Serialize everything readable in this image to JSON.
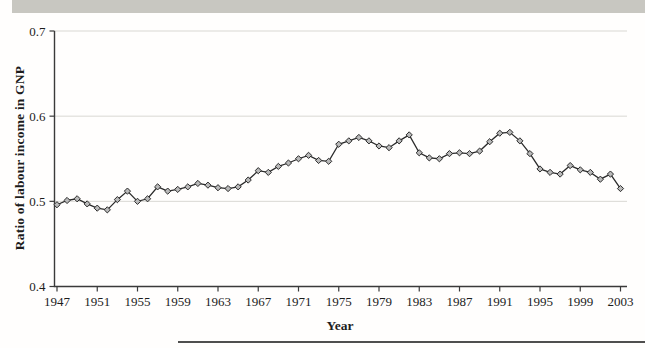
{
  "scan_artifacts": {
    "top_bar_color": "#c8c7c1",
    "bottom_rule_color": "#4f4f4f"
  },
  "chart_data": {
    "type": "line",
    "title": "",
    "ylabel": "Ratio of labour income in GNP",
    "xlabel": "Year",
    "legend": "none",
    "grid": "horizontal",
    "marker": "diamond",
    "ylim": [
      0.4,
      0.7
    ],
    "yticks": [
      0.4,
      0.5,
      0.6,
      0.7
    ],
    "ytick_labels": [
      "0.4",
      "0.5",
      "0.6",
      "0.7"
    ],
    "xticks": [
      1947,
      1951,
      1955,
      1959,
      1963,
      1967,
      1971,
      1975,
      1979,
      1983,
      1987,
      1991,
      1995,
      1999,
      2003
    ],
    "x": [
      1947,
      1948,
      1949,
      1950,
      1951,
      1952,
      1953,
      1954,
      1955,
      1956,
      1957,
      1958,
      1959,
      1960,
      1961,
      1962,
      1963,
      1964,
      1965,
      1966,
      1967,
      1968,
      1969,
      1970,
      1971,
      1972,
      1973,
      1974,
      1975,
      1976,
      1977,
      1978,
      1979,
      1980,
      1981,
      1982,
      1983,
      1984,
      1985,
      1986,
      1987,
      1988,
      1989,
      1990,
      1991,
      1992,
      1993,
      1994,
      1995,
      1996,
      1997,
      1998,
      1999,
      2000,
      2001,
      2002,
      2003
    ],
    "values": [
      0.496,
      0.501,
      0.503,
      0.497,
      0.492,
      0.49,
      0.502,
      0.512,
      0.5,
      0.503,
      0.517,
      0.512,
      0.514,
      0.517,
      0.521,
      0.519,
      0.516,
      0.515,
      0.517,
      0.525,
      0.536,
      0.534,
      0.541,
      0.545,
      0.55,
      0.554,
      0.548,
      0.547,
      0.567,
      0.571,
      0.575,
      0.571,
      0.565,
      0.563,
      0.571,
      0.578,
      0.557,
      0.551,
      0.55,
      0.556,
      0.557,
      0.556,
      0.559,
      0.57,
      0.58,
      0.581,
      0.571,
      0.556,
      0.538,
      0.534,
      0.532,
      0.542,
      0.537,
      0.534,
      0.526,
      0.532,
      0.515
    ],
    "colors": {
      "line": "#2b2b2b",
      "marker_fill": "#b9b9b9",
      "grid": "#d9d8d3",
      "axis": "#3a3a3a",
      "text": "#1c1c1c"
    }
  }
}
